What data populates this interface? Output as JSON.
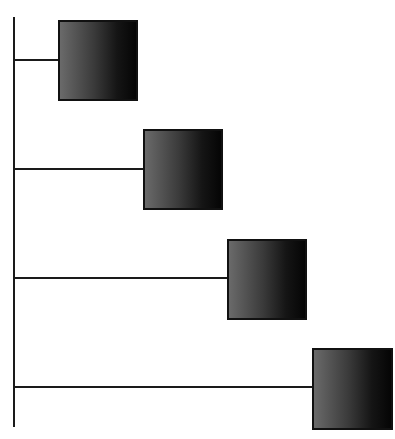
{
  "diagram": {
    "type": "staircase-tree",
    "colors": {
      "line": "#1a1a1a",
      "node_light": "#6a6a6a",
      "node_dark": "#050505",
      "background": "#ffffff"
    },
    "trunk": {
      "x": 13,
      "y": 17,
      "width": 2,
      "height": 410
    },
    "nodes": [
      {
        "id": "node-1",
        "x": 58,
        "y": 20,
        "size": 80,
        "branch_y": 59
      },
      {
        "id": "node-2",
        "x": 143,
        "y": 129,
        "size": 80,
        "branch_y": 168
      },
      {
        "id": "node-3",
        "x": 227,
        "y": 239,
        "size": 80,
        "branch_y": 277
      },
      {
        "id": "node-4",
        "x": 312,
        "y": 348,
        "size": 81,
        "branch_y": 386
      }
    ]
  }
}
